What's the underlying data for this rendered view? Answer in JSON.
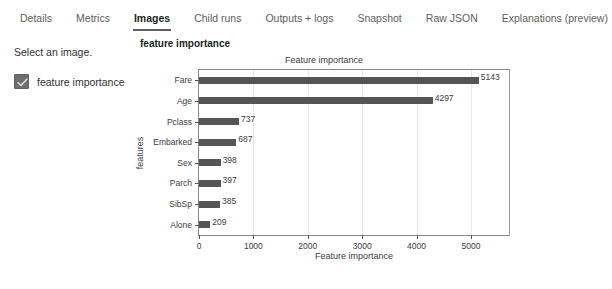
{
  "tabs": [
    {
      "label": "Details",
      "active": false
    },
    {
      "label": "Metrics",
      "active": false
    },
    {
      "label": "Images",
      "active": true
    },
    {
      "label": "Child runs",
      "active": false
    },
    {
      "label": "Outputs + logs",
      "active": false
    },
    {
      "label": "Snapshot",
      "active": false
    },
    {
      "label": "Raw JSON",
      "active": false
    },
    {
      "label": "Explanations (preview)",
      "active": false
    }
  ],
  "sidebar": {
    "select_label": "Select an image.",
    "items": [
      {
        "label": "feature importance",
        "checked": true,
        "icon": "checkbox-checked-icon"
      }
    ]
  },
  "main": {
    "panel_title": "feature importance"
  },
  "colors": {
    "bar": "#555555",
    "axis": "#888888",
    "grid": "#e6e6e6",
    "text": "#3b3b3b",
    "checkbox": "#6e6e6e"
  },
  "chart_data": {
    "type": "bar",
    "orientation": "horizontal",
    "title": "Feature importance",
    "xlabel": "Feature importance",
    "ylabel": "features",
    "categories": [
      "Fare",
      "Age",
      "Pclass",
      "Embarked",
      "Sex",
      "Parch",
      "SibSp",
      "Alone"
    ],
    "values": [
      5143,
      4297,
      737,
      687,
      398,
      397,
      385,
      209
    ],
    "xlim": [
      0,
      5700
    ],
    "xticks": [
      0,
      1000,
      2000,
      3000,
      4000,
      5000
    ],
    "xtick_labels": [
      "0",
      "1000",
      "2000",
      "3000",
      "4000",
      "5000"
    ],
    "grid": true,
    "legend": false,
    "data_labels": [
      "5143",
      "4297",
      "737",
      "687",
      "398",
      "397",
      "385",
      "209"
    ]
  }
}
